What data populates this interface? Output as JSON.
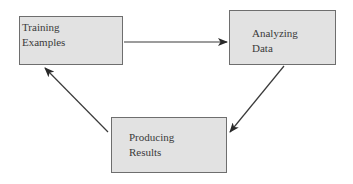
{
  "diagram": {
    "type": "cycle",
    "nodes": [
      {
        "id": "training",
        "lines": [
          "Training",
          "Examples"
        ]
      },
      {
        "id": "analyzing",
        "lines": [
          "Analyzing",
          "Data"
        ]
      },
      {
        "id": "producing",
        "lines": [
          "Producing",
          "Results"
        ]
      }
    ],
    "edges": [
      {
        "from": "training",
        "to": "analyzing"
      },
      {
        "from": "analyzing",
        "to": "producing"
      },
      {
        "from": "producing",
        "to": "training"
      }
    ],
    "colors": {
      "box_fill": "#e2e2e2",
      "box_border": "#6e6e6e",
      "arrow": "#3a3a3a",
      "text": "#3a3a3a"
    }
  }
}
